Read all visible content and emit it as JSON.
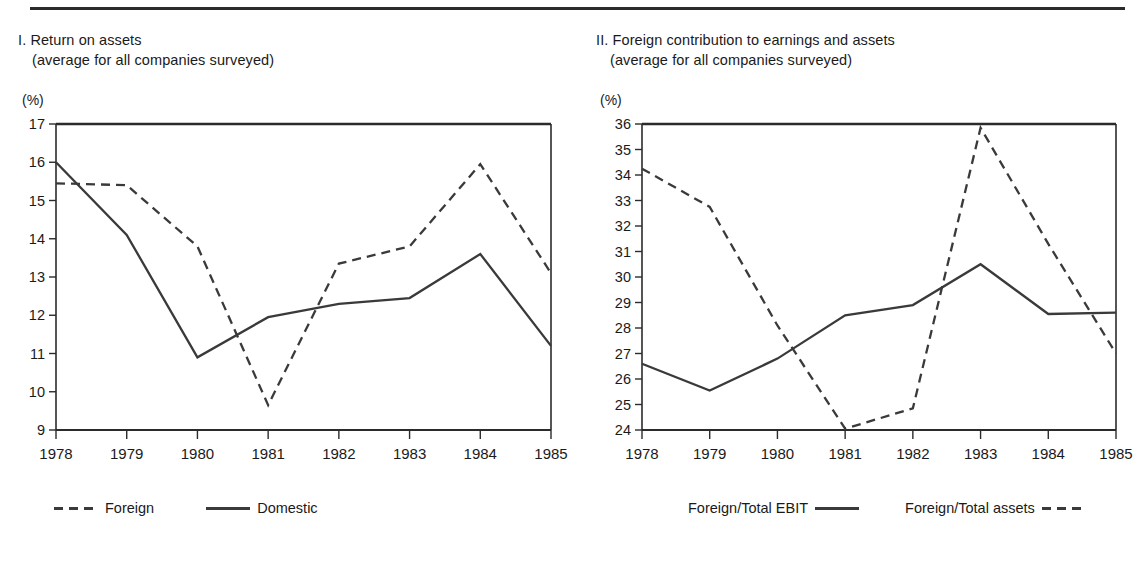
{
  "page": {
    "background": "#ffffff",
    "ink": "#1a1a1a",
    "line_color": "#3a3a3a"
  },
  "panels": [
    {
      "id": "return-on-assets",
      "caption_line1": "I. Return on assets",
      "caption_line2": "(average for all companies surveyed)",
      "unit": "(%)",
      "legend_order": "marker-first",
      "legend": [
        {
          "label": "Foreign",
          "style": "dashed"
        },
        {
          "label": "Domestic",
          "style": "solid"
        }
      ]
    },
    {
      "id": "foreign-contribution",
      "caption_line1": "II. Foreign contribution to earnings and assets",
      "caption_line2": "(average for all companies surveyed)",
      "unit": "(%)",
      "legend_order": "label-first",
      "legend": [
        {
          "label": "Foreign/Total EBIT",
          "style": "solid"
        },
        {
          "label": "Foreign/Total assets",
          "style": "dashed"
        }
      ]
    }
  ],
  "chart_data": [
    {
      "type": "line",
      "title": "I. Return on assets",
      "subtitle": "(average for all companies surveyed)",
      "xlabel": "",
      "ylabel": "(%)",
      "x": [
        "1978",
        "1979",
        "1980",
        "1981",
        "1982",
        "1983",
        "1984",
        "1985"
      ],
      "xlim": [
        1978,
        1985
      ],
      "ylim": [
        9,
        17
      ],
      "yticks": [
        9,
        10,
        11,
        12,
        13,
        14,
        15,
        16,
        17
      ],
      "grid": false,
      "legend_position": "bottom",
      "series": [
        {
          "name": "Foreign",
          "style": "dashed",
          "values": [
            15.45,
            15.4,
            13.8,
            9.65,
            13.35,
            13.8,
            15.95,
            13.1
          ]
        },
        {
          "name": "Domestic",
          "style": "solid",
          "values": [
            16.0,
            14.1,
            10.9,
            11.95,
            12.3,
            12.45,
            13.6,
            11.2
          ]
        }
      ]
    },
    {
      "type": "line",
      "title": "II. Foreign contribution to earnings and assets",
      "subtitle": "(average for all companies surveyed)",
      "xlabel": "",
      "ylabel": "(%)",
      "x": [
        "1978",
        "1979",
        "1980",
        "1981",
        "1982",
        "1983",
        "1984",
        "1985"
      ],
      "xlim": [
        1978,
        1985
      ],
      "ylim": [
        24,
        36
      ],
      "yticks": [
        24,
        25,
        26,
        27,
        28,
        29,
        30,
        31,
        32,
        33,
        34,
        35,
        36
      ],
      "grid": false,
      "legend_position": "bottom",
      "series": [
        {
          "name": "Foreign/Total EBIT",
          "style": "solid",
          "values": [
            26.6,
            25.55,
            26.8,
            28.5,
            28.9,
            30.5,
            28.55,
            28.6
          ]
        },
        {
          "name": "Foreign/Total assets",
          "style": "dashed",
          "values": [
            34.25,
            32.75,
            28.1,
            24.05,
            24.85,
            35.85,
            31.3,
            27.0
          ]
        }
      ]
    }
  ]
}
